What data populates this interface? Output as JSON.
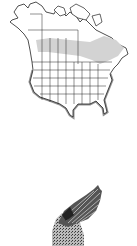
{
  "map": {
    "region": "North America",
    "range_color": "#d3d3d3",
    "outline_color": "#222222",
    "land_color": "#ffffff",
    "shadow_color": "#777777"
  },
  "illustration": {
    "subject": "bird-wing",
    "tone": "grayscale"
  }
}
